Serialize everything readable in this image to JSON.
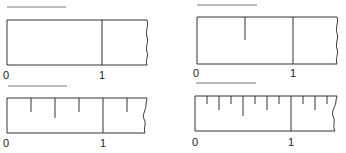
{
  "figure": {
    "panels": [
      {
        "id": "whole",
        "divisions": 1,
        "labels": {
          "zero": "0",
          "one": "1"
        },
        "answer_line": ""
      },
      {
        "id": "halves",
        "divisions": 2,
        "labels": {
          "zero": "0",
          "one": "1"
        },
        "answer_line": ""
      },
      {
        "id": "quarters",
        "divisions": 4,
        "labels": {
          "zero": "0",
          "one": "1"
        },
        "answer_line": ""
      },
      {
        "id": "eighths",
        "divisions": 8,
        "labels": {
          "zero": "0",
          "one": "1"
        },
        "answer_line": ""
      }
    ]
  },
  "colors": {
    "stroke": "#333333",
    "answer_line": "#777777",
    "background": "#ffffff"
  }
}
